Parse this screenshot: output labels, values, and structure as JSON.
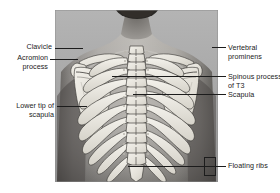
{
  "figure": {
    "type": "anatomy-illustration",
    "background_color": "#ffffff",
    "label_color": "#1b1b1b",
    "leader_color": "#1c1c1c"
  },
  "labels": {
    "clavicle": "Clavicle",
    "acromion_line1": "Acromion",
    "acromion_line2": "process",
    "lower_tip_line1": "Lower tip of",
    "lower_tip_line2": "scapula",
    "vertebral_line1": "Vertebral",
    "vertebral_line2": "prominens",
    "spinous_line1": "Spinous process",
    "spinous_line2": "of T3",
    "scapula": "Scapula",
    "floating_ribs": "Floating ribs"
  }
}
